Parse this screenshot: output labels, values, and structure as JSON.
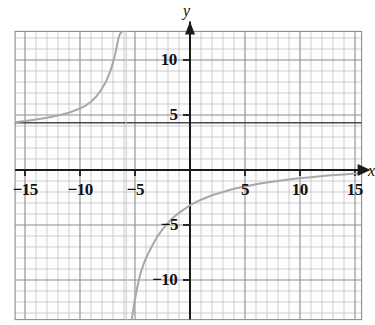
{
  "figure": {
    "kind": "coordinate-plane-graph",
    "background_color": "#ffffff",
    "grid_color": "#b9b9b9",
    "grid_major_color": "#8d8d8d",
    "axis_color": "#1a1a1a",
    "curve_color": "#a8a8a8",
    "asymptote_color": "#4a4a4a",
    "axis_labels": {
      "x": "x",
      "y": "y"
    }
  },
  "axes": {
    "x_ticks": [
      {
        "value": -15,
        "label": "−15"
      },
      {
        "value": -10,
        "label": "−10"
      },
      {
        "value": -5,
        "label": "−5"
      },
      {
        "value": 5,
        "label": "5"
      },
      {
        "value": 10,
        "label": "10"
      },
      {
        "value": 15,
        "label": "15"
      }
    ],
    "y_ticks": [
      {
        "value": 10,
        "label": "10"
      },
      {
        "value": 5,
        "label": "5"
      },
      {
        "value": -5,
        "label": "−5"
      },
      {
        "value": -10,
        "label": "−10"
      }
    ]
  },
  "chart_data": {
    "type": "line",
    "title": "",
    "xlabel": "x",
    "ylabel": "y",
    "xlim": [
      -15.9,
      15.6
    ],
    "ylim": [
      -13.6,
      12.6
    ],
    "grid": true,
    "grid_step": 1,
    "tick_step": 5,
    "legend": "none",
    "annotations": [
      {
        "name": "horizontal-asymptote",
        "type": "hline",
        "y": 4.3
      },
      {
        "name": "vertical-asymptote",
        "type": "vline",
        "x": -5.8
      }
    ],
    "series": [
      {
        "name": "upper-left-branch",
        "comment": "branch left of the vertical asymptote, rising steeply; approaches y=4.3 from above as x decreases",
        "x": [
          -15.9,
          -15.0,
          -14.0,
          -13.0,
          -12.0,
          -11.0,
          -10.0,
          -9.5,
          -9.0,
          -8.5,
          -8.0,
          -7.6,
          -7.2,
          -6.9,
          -6.7,
          -6.5,
          -6.35,
          -6.2,
          -6.1
        ],
        "y": [
          4.35,
          4.45,
          4.6,
          4.75,
          4.95,
          5.2,
          5.6,
          5.85,
          6.2,
          6.7,
          7.4,
          8.1,
          9.1,
          10.1,
          11.0,
          12.0,
          12.4,
          12.6,
          12.6
        ]
      },
      {
        "name": "lower-right-branch",
        "comment": "branch right of the vertical asymptote, rising from -13.6 toward y=0 as x increases",
        "x": [
          -5.3,
          -5.2,
          -5.05,
          -4.9,
          -4.7,
          -4.5,
          -4.2,
          -3.9,
          -3.5,
          -3.0,
          -2.5,
          -2.0,
          -1.5,
          -1.0,
          0.0,
          1.0,
          2.0,
          3.0,
          4.0,
          5.0,
          6.5,
          8.0,
          9.5,
          11.0,
          12.5,
          14.0,
          15.3
        ],
        "y": [
          -13.6,
          -13.0,
          -12.0,
          -11.2,
          -10.2,
          -9.4,
          -8.5,
          -7.8,
          -7.0,
          -6.1,
          -5.4,
          -4.8,
          -4.3,
          -3.9,
          -3.2,
          -2.7,
          -2.3,
          -2.0,
          -1.7,
          -1.5,
          -1.2,
          -1.0,
          -0.8,
          -0.65,
          -0.5,
          -0.4,
          -0.3
        ]
      }
    ]
  }
}
